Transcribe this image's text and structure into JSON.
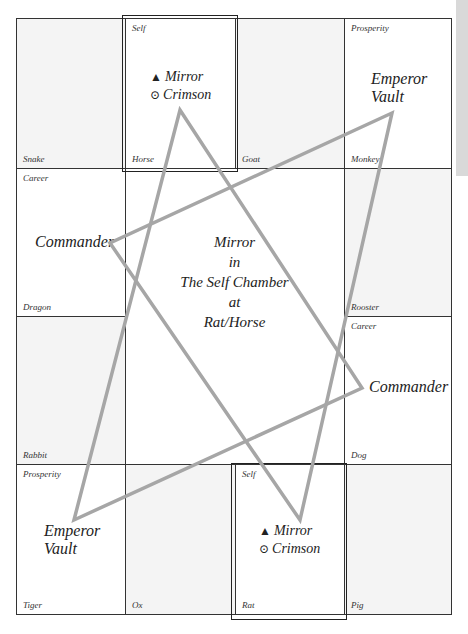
{
  "chart_title": "Mirror in The Self Chamber at Rat/Horse",
  "center": {
    "line1": "Mirror",
    "line2": "in",
    "line3": "The Self Chamber",
    "line4": "at",
    "line5": "Rat/Horse"
  },
  "cells": {
    "snake": {
      "bottom": "Snake"
    },
    "horse": {
      "top": "Self",
      "bottom": "Horse"
    },
    "goat": {
      "bottom": "Goat"
    },
    "monkey": {
      "top": "Prosperity",
      "bottom": "Monkey"
    },
    "dragon": {
      "top": "Career",
      "bottom": "Dragon"
    },
    "rooster": {
      "bottom": "Rooster"
    },
    "rabbit": {
      "bottom": "Rabbit"
    },
    "dog": {
      "top": "Career",
      "bottom": "Dog"
    },
    "tiger": {
      "top": "Prosperity",
      "bottom": "Tiger"
    },
    "ox": {
      "bottom": "Ox"
    },
    "rat": {
      "top": "Self",
      "bottom": "Rat"
    },
    "pig": {
      "bottom": "Pig"
    }
  },
  "stars": {
    "horse_mirror": "Mirror",
    "horse_crimson": "Crimson",
    "rat_mirror": "Mirror",
    "rat_crimson": "Crimson",
    "monkey_emperor": "Emperor",
    "monkey_vault": "Vault",
    "tiger_emperor": "Emperor",
    "tiger_vault": "Vault",
    "dragon_commander": "Commander",
    "dog_commander": "Commander"
  },
  "symbols": {
    "triangle": "▲",
    "circle_dot": "⊙"
  },
  "colors": {
    "grid_line": "#333333",
    "shaded_cell": "#f4f4f4",
    "triangle_line": "#a6a6a6",
    "side_tab": "#d9d9d9"
  }
}
